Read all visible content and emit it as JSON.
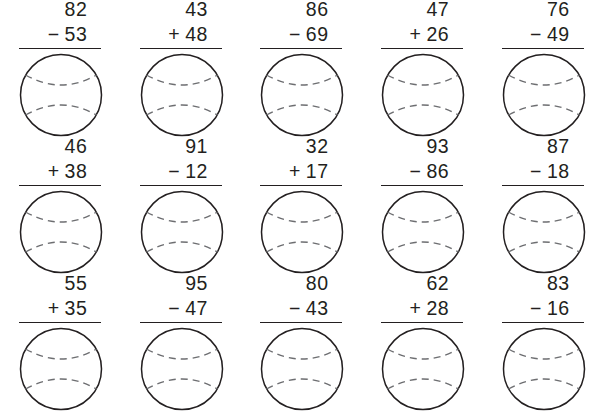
{
  "worksheet": {
    "title": "Two-digit addition and subtraction practice",
    "columns": 5,
    "rows": 3,
    "answer_shape": "baseball-circle",
    "answer_value": "",
    "ink_color": "#231f20",
    "seam_color": "#6d6e71",
    "background_color": "#ffffff",
    "problems": [
      {
        "id": "problem-1",
        "top": "82",
        "operator": "−",
        "bottom": "53",
        "answer": ""
      },
      {
        "id": "problem-2",
        "top": "43",
        "operator": "+",
        "bottom": "48",
        "answer": ""
      },
      {
        "id": "problem-3",
        "top": "86",
        "operator": "−",
        "bottom": "69",
        "answer": ""
      },
      {
        "id": "problem-4",
        "top": "47",
        "operator": "+",
        "bottom": "26",
        "answer": ""
      },
      {
        "id": "problem-5",
        "top": "76",
        "operator": "−",
        "bottom": "49",
        "answer": ""
      },
      {
        "id": "problem-6",
        "top": "46",
        "operator": "+",
        "bottom": "38",
        "answer": ""
      },
      {
        "id": "problem-7",
        "top": "91",
        "operator": "−",
        "bottom": "12",
        "answer": ""
      },
      {
        "id": "problem-8",
        "top": "32",
        "operator": "+",
        "bottom": "17",
        "answer": ""
      },
      {
        "id": "problem-9",
        "top": "93",
        "operator": "−",
        "bottom": "86",
        "answer": ""
      },
      {
        "id": "problem-10",
        "top": "87",
        "operator": "−",
        "bottom": "18",
        "answer": ""
      },
      {
        "id": "problem-11",
        "top": "55",
        "operator": "+",
        "bottom": "35",
        "answer": ""
      },
      {
        "id": "problem-12",
        "top": "95",
        "operator": "−",
        "bottom": "47",
        "answer": ""
      },
      {
        "id": "problem-13",
        "top": "80",
        "operator": "−",
        "bottom": "43",
        "answer": ""
      },
      {
        "id": "problem-14",
        "top": "62",
        "operator": "+",
        "bottom": "28",
        "answer": ""
      },
      {
        "id": "problem-15",
        "top": "83",
        "operator": "−",
        "bottom": "16",
        "answer": ""
      }
    ]
  }
}
